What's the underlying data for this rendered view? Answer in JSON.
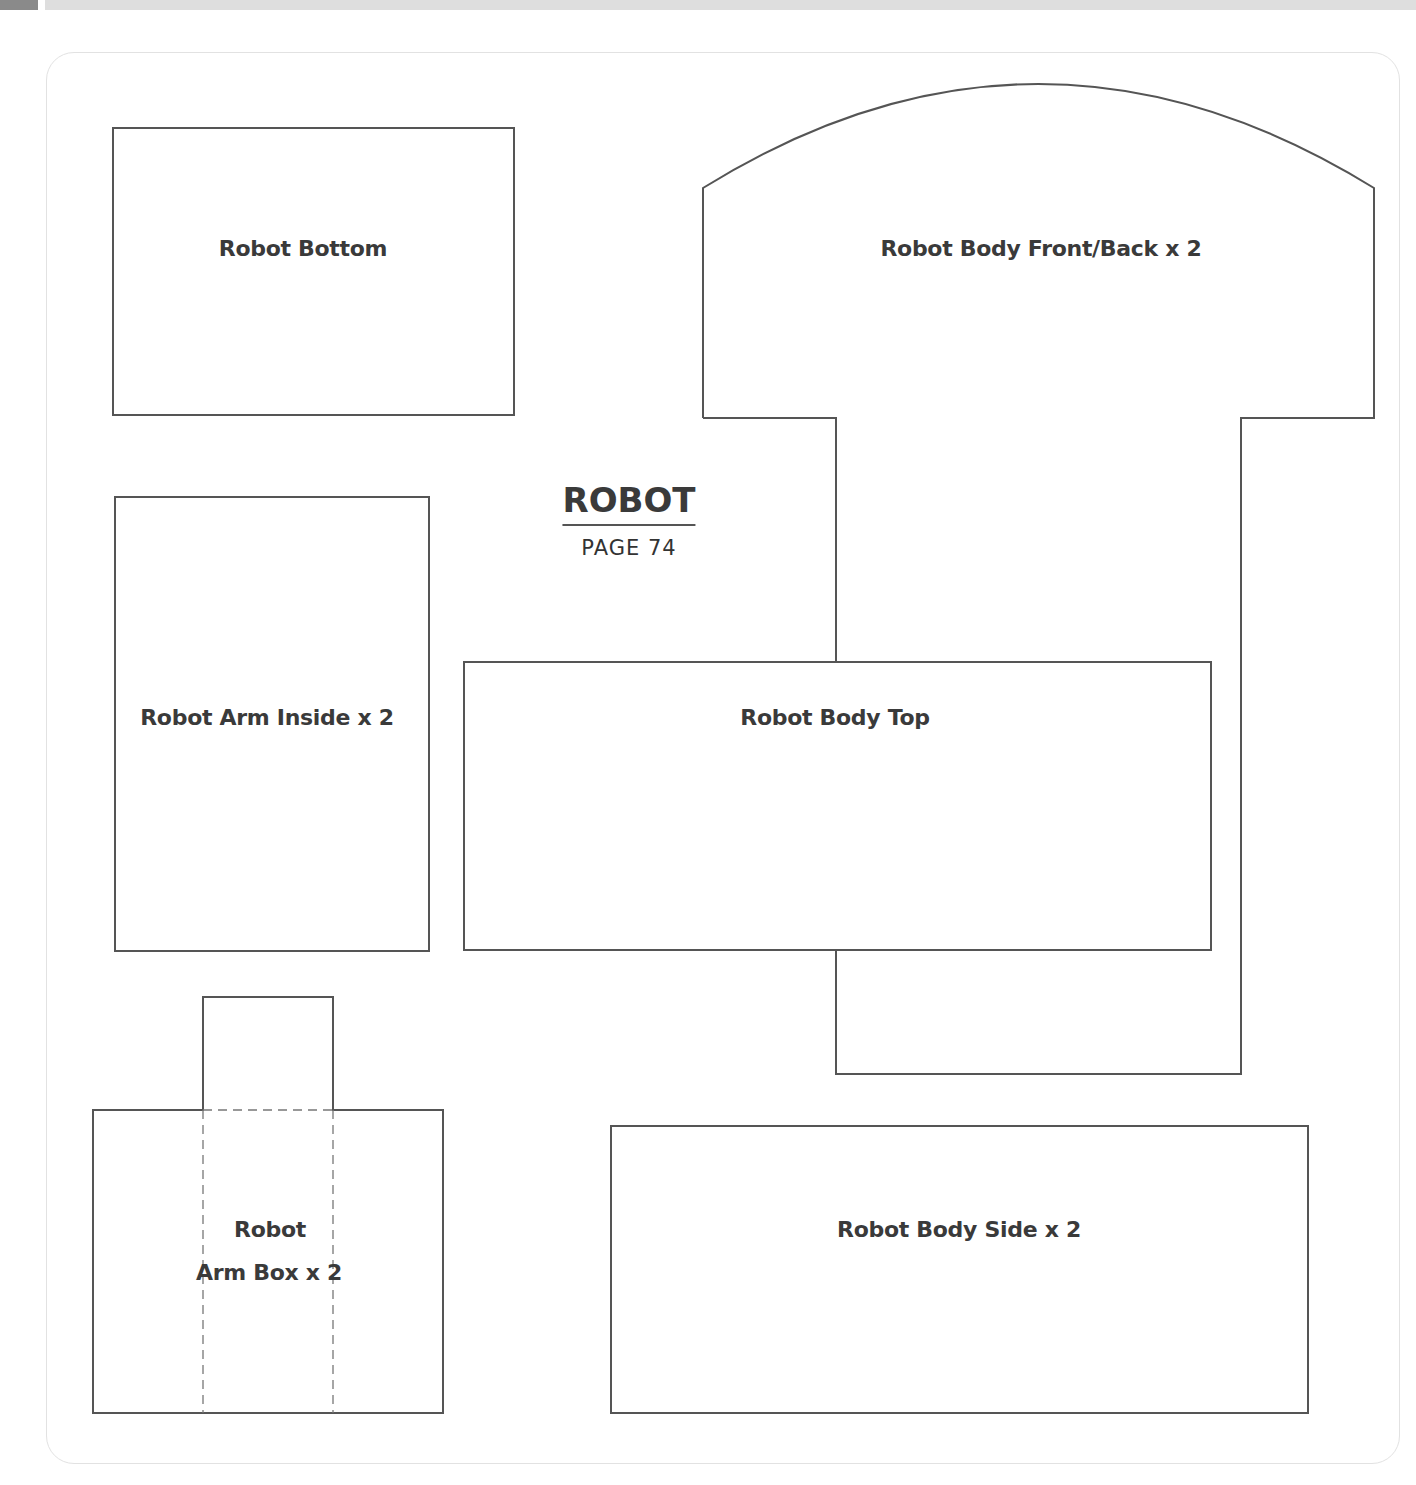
{
  "header": {
    "tab_color": "#8a8a8a",
    "bar_color": "#dedede"
  },
  "title": {
    "heading": "ROBOT",
    "page": "PAGE 74"
  },
  "pieces": [
    {
      "label": "Robot Bottom"
    },
    {
      "label": "Robot Body Front/Back x 2"
    },
    {
      "label": "Robot Arm Inside x 2"
    },
    {
      "label": "Robot Body Top"
    },
    {
      "label": "Robot",
      "label2": "Arm Box x 2"
    },
    {
      "label": "Robot Body Side x 2"
    }
  ],
  "colors": {
    "outline": "#555555",
    "text": "#3a3a3a"
  }
}
